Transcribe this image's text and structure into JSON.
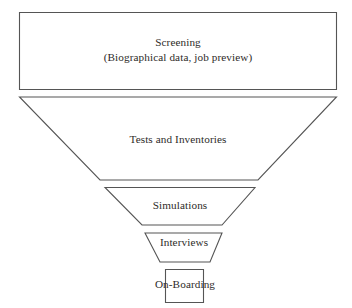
{
  "diagram": {
    "type": "funnel",
    "orientation": "vertical-descending",
    "background_color": "#ffffff",
    "stroke_color": "#555555",
    "text_color": "#2e2b29",
    "stages": [
      {
        "id": "screening",
        "shape": "rectangle",
        "order": 1,
        "title": "Screening",
        "subtitle": "(Biographical data, job preview)"
      },
      {
        "id": "tests-and-inventories",
        "shape": "trapezoid",
        "order": 2,
        "title": "Tests and Inventories",
        "subtitle": ""
      },
      {
        "id": "simulations",
        "shape": "trapezoid",
        "order": 3,
        "title": "Simulations",
        "subtitle": ""
      },
      {
        "id": "interviews",
        "shape": "trapezoid",
        "order": 4,
        "title": "Interviews",
        "subtitle": ""
      },
      {
        "id": "on-boarding",
        "shape": "rectangle",
        "order": 5,
        "title": "On-Boarding",
        "subtitle": ""
      }
    ]
  }
}
